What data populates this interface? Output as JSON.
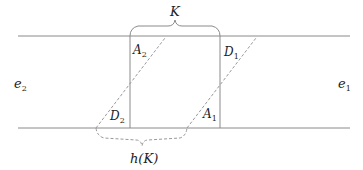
{
  "diagram": {
    "labels": {
      "K": "K",
      "hK": "h(K)",
      "e1_base": "e",
      "e1_sub": "1",
      "e2_base": "e",
      "e2_sub": "2",
      "A1_base": "A",
      "A1_sub": "1",
      "A2_base": "A",
      "A2_sub": "2",
      "D1_base": "D",
      "D1_sub": "1",
      "D2_base": "D",
      "D2_sub": "2"
    },
    "colors": {
      "line": "#8a8a8a",
      "text": "#222222"
    }
  }
}
